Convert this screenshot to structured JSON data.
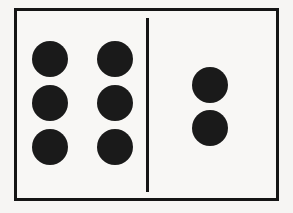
{
  "image": {
    "kind": "domino-tile",
    "title": "Domino six-two",
    "background_color": "#f6f5f3",
    "tile_fill_color": "#f8f7f5",
    "ink_color": "#151515",
    "pip_color": "#1a1a1a"
  },
  "domino": {
    "notation": "6-2",
    "total_pips": 8,
    "left_half": {
      "label": "left-half",
      "pip_count": 6,
      "arrangement": "2 columns x 3 rows",
      "pips": [
        {
          "name": "pip-left-1",
          "column": "a",
          "row": 1
        },
        {
          "name": "pip-left-2",
          "column": "b",
          "row": 1
        },
        {
          "name": "pip-left-3",
          "column": "a",
          "row": 2
        },
        {
          "name": "pip-left-4",
          "column": "b",
          "row": 2
        },
        {
          "name": "pip-left-5",
          "column": "a",
          "row": 3
        },
        {
          "name": "pip-left-6",
          "column": "b",
          "row": 3
        }
      ]
    },
    "right_half": {
      "label": "right-half",
      "pip_count": 2,
      "arrangement": "1 column x 2 rows",
      "pips": [
        {
          "name": "pip-right-1",
          "column": "r",
          "row": 1
        },
        {
          "name": "pip-right-2",
          "column": "r",
          "row": 2
        }
      ]
    },
    "divider": {
      "name": "center-divider",
      "orientation": "vertical"
    }
  }
}
